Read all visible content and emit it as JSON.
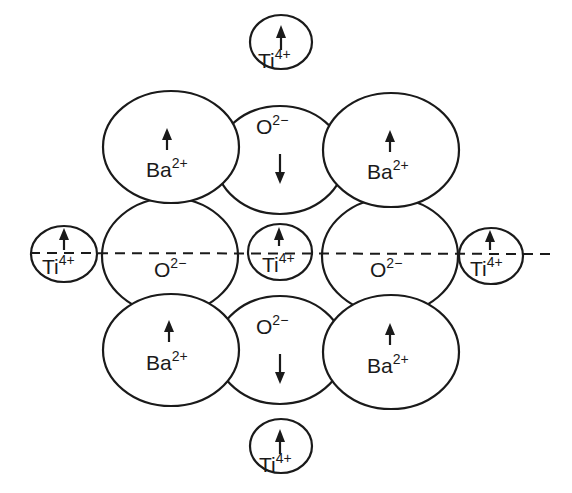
{
  "diagram": {
    "title": "",
    "ions": {
      "ti_top": {
        "symbol": "Ti",
        "charge": "4+",
        "spin": "up"
      },
      "ba_top_left": {
        "symbol": "Ba",
        "charge": "2+",
        "spin": "up"
      },
      "o_top": {
        "symbol": "O",
        "charge": "2−",
        "spin": "down"
      },
      "ba_top_right": {
        "symbol": "Ba",
        "charge": "2+",
        "spin": "up"
      },
      "ti_left": {
        "symbol": "Ti",
        "charge": "4+",
        "spin": "up"
      },
      "o_mid_left": {
        "symbol": "O",
        "charge": "2−",
        "spin": "none"
      },
      "ti_center": {
        "symbol": "Ti",
        "charge": "4+",
        "spin": "up"
      },
      "o_mid_right": {
        "symbol": "O",
        "charge": "2−",
        "spin": "none"
      },
      "ti_right": {
        "symbol": "Ti",
        "charge": "4+",
        "spin": "up"
      },
      "ba_bottom_left": {
        "symbol": "Ba",
        "charge": "2+",
        "spin": "up"
      },
      "o_bottom": {
        "symbol": "O",
        "charge": "2−",
        "spin": "down"
      },
      "ba_bottom_right": {
        "symbol": "Ba",
        "charge": "2+",
        "spin": "up"
      },
      "ti_bottom": {
        "symbol": "Ti",
        "charge": "4+",
        "spin": "up"
      }
    },
    "dashed_line": {
      "label": "",
      "orientation": "horizontal"
    },
    "colors": {
      "stroke": "#1a1a1a",
      "fill": "#ffffff",
      "background": "#ffffff"
    }
  }
}
